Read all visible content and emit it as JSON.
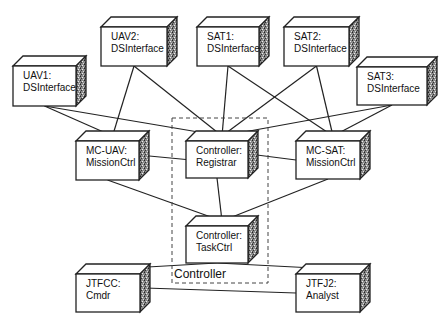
{
  "diagram": {
    "type": "UML deployment diagram",
    "package": {
      "label": "Controller",
      "x": 172,
      "y": 118,
      "w": 96,
      "h": 165
    },
    "nodes": [
      {
        "id": "uav1",
        "line1": "UAV1:",
        "line2": "DSInterface",
        "x": 13,
        "y": 66,
        "w": 63,
        "h": 40
      },
      {
        "id": "uav2",
        "line1": "UAV2:",
        "line2": "DSInterface",
        "x": 101,
        "y": 27,
        "w": 66,
        "h": 39
      },
      {
        "id": "sat1",
        "line1": "SAT1:",
        "line2": "DSInterface",
        "x": 197,
        "y": 27,
        "w": 62,
        "h": 39
      },
      {
        "id": "sat2",
        "line1": "SAT2:",
        "line2": "DSInterface",
        "x": 284,
        "y": 27,
        "w": 65,
        "h": 39
      },
      {
        "id": "sat3",
        "line1": "SAT3:",
        "line2": "DSInterface",
        "x": 357,
        "y": 67,
        "w": 70,
        "h": 38
      },
      {
        "id": "mcuav",
        "line1": "MC-UAV:",
        "line2": "MissionCtrl",
        "x": 76,
        "y": 141,
        "w": 63,
        "h": 39
      },
      {
        "id": "creg",
        "line1": "Controller:",
        "line2": "Registrar",
        "x": 186,
        "y": 141,
        "w": 62,
        "h": 37
      },
      {
        "id": "mcsat",
        "line1": "MC-SAT:",
        "line2": "MissionCtrl",
        "x": 296,
        "y": 141,
        "w": 64,
        "h": 38
      },
      {
        "id": "ctask",
        "line1": "Controller:",
        "line2": "TaskCtrl",
        "x": 186,
        "y": 226,
        "w": 62,
        "h": 37
      },
      {
        "id": "jtfcc",
        "line1": "JTFCC:",
        "line2": "Cmdr",
        "x": 76,
        "y": 274,
        "w": 64,
        "h": 38
      },
      {
        "id": "jtfj2",
        "line1": "JTFJ2:",
        "line2": "Analyst",
        "x": 296,
        "y": 274,
        "w": 64,
        "h": 38
      }
    ],
    "connections": [
      {
        "from": "uav1",
        "to": "mcuav"
      },
      {
        "from": "uav1",
        "to": "creg"
      },
      {
        "from": "uav2",
        "to": "mcuav"
      },
      {
        "from": "uav2",
        "to": "creg"
      },
      {
        "from": "sat1",
        "to": "creg"
      },
      {
        "from": "sat1",
        "to": "mcsat"
      },
      {
        "from": "sat2",
        "to": "creg"
      },
      {
        "from": "sat2",
        "to": "mcsat"
      },
      {
        "from": "sat3",
        "to": "creg"
      },
      {
        "from": "sat3",
        "to": "mcsat"
      },
      {
        "from": "mcuav",
        "to": "creg"
      },
      {
        "from": "mcsat",
        "to": "creg"
      },
      {
        "from": "mcuav",
        "to": "ctask"
      },
      {
        "from": "mcsat",
        "to": "ctask"
      },
      {
        "from": "creg",
        "to": "ctask"
      },
      {
        "from": "jtfcc",
        "to": "ctask"
      },
      {
        "from": "jtfj2",
        "to": "ctask"
      },
      {
        "from": "jtfcc",
        "to": "jtfj2"
      }
    ]
  }
}
